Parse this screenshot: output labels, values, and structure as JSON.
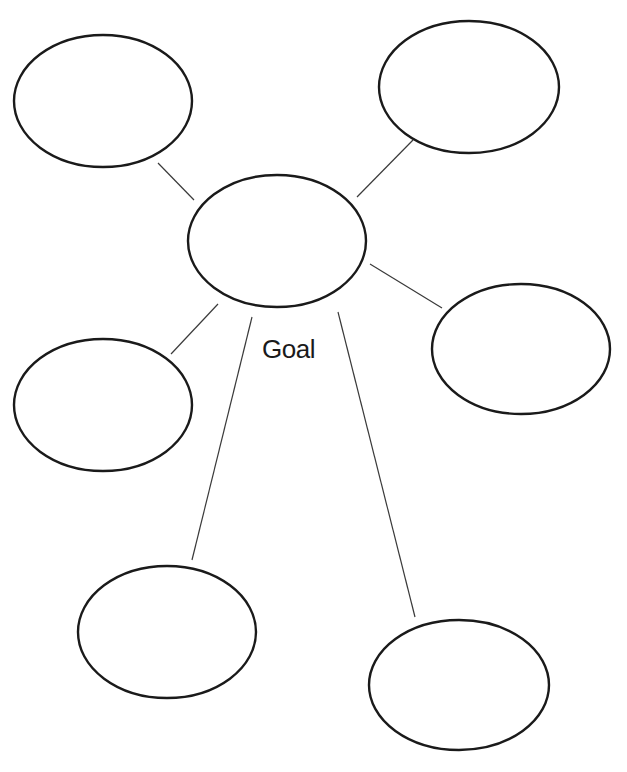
{
  "diagram": {
    "type": "web-organizer",
    "label": "Goal",
    "stroke_color": "#1a1a1a",
    "connector_color": "#3a3a3a",
    "center": {
      "cx": 277,
      "cy": 241,
      "rx": 89,
      "ry": 66,
      "text": ""
    },
    "nodes": [
      {
        "id": "top-left",
        "cx": 103,
        "cy": 101,
        "rx": 89,
        "ry": 66,
        "text": "",
        "connector": [
          158,
          163,
          194,
          200
        ]
      },
      {
        "id": "top-right",
        "cx": 469,
        "cy": 87,
        "rx": 90,
        "ry": 66,
        "text": "",
        "connector": [
          413,
          140,
          357,
          197
        ]
      },
      {
        "id": "right",
        "cx": 521,
        "cy": 349,
        "rx": 89,
        "ry": 65,
        "text": "",
        "connector": [
          370,
          264,
          442,
          308
        ]
      },
      {
        "id": "left",
        "cx": 103,
        "cy": 405,
        "rx": 89,
        "ry": 66,
        "text": "",
        "connector": [
          218,
          304,
          171,
          354
        ]
      },
      {
        "id": "bottom-left",
        "cx": 167,
        "cy": 632,
        "rx": 89,
        "ry": 66,
        "text": "",
        "connector": [
          252,
          317,
          192,
          560
        ]
      },
      {
        "id": "bottom-right",
        "cx": 459,
        "cy": 685,
        "rx": 90,
        "ry": 65,
        "text": "",
        "connector": [
          338,
          312,
          415,
          617
        ]
      }
    ]
  }
}
